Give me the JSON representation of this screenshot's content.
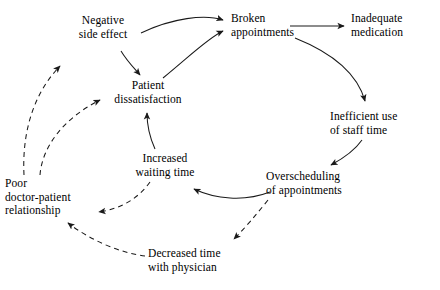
{
  "diagram": {
    "type": "causal-loop-diagram",
    "title": "",
    "background_color": "#ffffff",
    "line_color": "#1a1a1a",
    "text_color": "#000000",
    "nodes": [
      {
        "id": "negative_side_effect",
        "label": "Negative\nside effect",
        "x": 66,
        "y": 14,
        "align": "center"
      },
      {
        "id": "broken_appointments",
        "label": "Broken\nappointments",
        "x": 231,
        "y": 12,
        "align": "left"
      },
      {
        "id": "inadequate_medication",
        "label": "Inadequate\nmedication",
        "x": 351,
        "y": 12,
        "align": "left"
      },
      {
        "id": "patient_dissatisfaction",
        "label": "Patient\ndissatisfaction",
        "x": 108,
        "y": 79,
        "align": "center"
      },
      {
        "id": "inefficient_staff_time",
        "label": "Inefficient use\nof staff time",
        "x": 330,
        "y": 110,
        "align": "left"
      },
      {
        "id": "increased_waiting_time",
        "label": "Increased\nwaiting time",
        "x": 127,
        "y": 152,
        "align": "center"
      },
      {
        "id": "overscheduling",
        "label": "Overscheduling\nof appointments",
        "x": 266,
        "y": 170,
        "align": "left"
      },
      {
        "id": "poor_relationship",
        "label": "Poor\ndoctor-patient\nrelationship",
        "x": 5,
        "y": 177,
        "align": "left"
      },
      {
        "id": "decreased_time",
        "label": "Decreased time\nwith physician",
        "x": 148,
        "y": 247,
        "align": "left"
      }
    ],
    "edges": [
      {
        "id": "e1",
        "from": "negative_side_effect",
        "to": "broken_appointments",
        "style": "solid",
        "label": ""
      },
      {
        "id": "e2",
        "from": "patient_dissatisfaction",
        "to": "broken_appointments",
        "style": "solid",
        "label": ""
      },
      {
        "id": "e3",
        "from": "negative_side_effect",
        "to": "patient_dissatisfaction",
        "style": "solid",
        "label": ""
      },
      {
        "id": "e4",
        "from": "broken_appointments",
        "to": "inadequate_medication",
        "style": "solid",
        "label": ""
      },
      {
        "id": "e5",
        "from": "broken_appointments",
        "to": "inefficient_staff_time",
        "style": "solid",
        "label": ""
      },
      {
        "id": "e6",
        "from": "inefficient_staff_time",
        "to": "overscheduling",
        "style": "solid",
        "label": ""
      },
      {
        "id": "e7",
        "from": "overscheduling",
        "to": "increased_waiting_time",
        "style": "solid",
        "label": ""
      },
      {
        "id": "e8",
        "from": "increased_waiting_time",
        "to": "patient_dissatisfaction",
        "style": "solid",
        "label": ""
      },
      {
        "id": "e9",
        "from": "increased_waiting_time",
        "to": "poor_relationship",
        "style": "dashed",
        "label": ""
      },
      {
        "id": "e10",
        "from": "overscheduling",
        "to": "decreased_time",
        "style": "dashed",
        "label": ""
      },
      {
        "id": "e11",
        "from": "decreased_time",
        "to": "poor_relationship",
        "style": "dashed",
        "label": ""
      },
      {
        "id": "e12",
        "from": "poor_relationship",
        "to": "negative_side_effect",
        "style": "dashed",
        "label": ""
      },
      {
        "id": "e13",
        "from": "poor_relationship",
        "to": "patient_dissatisfaction",
        "style": "dashed",
        "label": ""
      }
    ]
  }
}
